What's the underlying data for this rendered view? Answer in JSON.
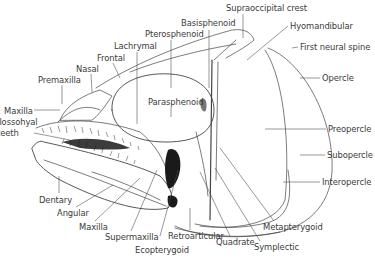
{
  "diagram": {
    "labels": [
      {
        "id": "supraoccipital-crest",
        "text": "Supraoccipital crest",
        "x": 226,
        "y": 3
      },
      {
        "id": "basisphenoid",
        "text": "Basisphenoid",
        "x": 181,
        "y": 18
      },
      {
        "id": "hyomandibular",
        "text": "Hyomandibular",
        "x": 290,
        "y": 21
      },
      {
        "id": "pterosphenoid",
        "text": "Pterosphenoid",
        "x": 145,
        "y": 29
      },
      {
        "id": "first-neural-spine",
        "text": "First neural spine",
        "x": 300,
        "y": 42
      },
      {
        "id": "lachrymal",
        "text": "Lachrymal",
        "x": 114,
        "y": 41
      },
      {
        "id": "frontal",
        "text": "Frontal",
        "x": 97,
        "y": 53
      },
      {
        "id": "nasal",
        "text": "Nasal",
        "x": 76,
        "y": 64
      },
      {
        "id": "premaxilla",
        "text": "Premaxilla",
        "x": 38,
        "y": 75
      },
      {
        "id": "opercle",
        "text": "Opercle",
        "x": 322,
        "y": 73
      },
      {
        "id": "parasphenoid",
        "text": "Parasphenoid",
        "x": 148,
        "y": 97
      },
      {
        "id": "maxilla-top",
        "text": "Maxilla",
        "x": 4,
        "y": 106
      },
      {
        "id": "glossohyal-teeth-1",
        "text": "Glossohyal",
        "x": 0,
        "y": 117
      },
      {
        "id": "glossohyal-teeth-2",
        "text": "teeth",
        "x": 0,
        "y": 128
      },
      {
        "id": "preopercle",
        "text": "Preopercle",
        "x": 328,
        "y": 124
      },
      {
        "id": "subopercle",
        "text": "Subopercle",
        "x": 327,
        "y": 150
      },
      {
        "id": "interopercle",
        "text": "Interopercle",
        "x": 322,
        "y": 177
      },
      {
        "id": "dentary",
        "text": "Dentary",
        "x": 39,
        "y": 195
      },
      {
        "id": "angular",
        "text": "Angular",
        "x": 57,
        "y": 208
      },
      {
        "id": "maxilla-bottom",
        "text": "Maxilla",
        "x": 79,
        "y": 222
      },
      {
        "id": "metapterygoid",
        "text": "Metapterygoid",
        "x": 263,
        "y": 222
      },
      {
        "id": "supermaxilla",
        "text": "Supermaxilla",
        "x": 105,
        "y": 232
      },
      {
        "id": "retroarticular",
        "text": "Retroarticular",
        "x": 168,
        "y": 231
      },
      {
        "id": "quadrate",
        "text": "Quadrate",
        "x": 216,
        "y": 237
      },
      {
        "id": "symplectic",
        "text": "Symplectic",
        "x": 254,
        "y": 242
      },
      {
        "id": "ecopterygoid",
        "text": "Ecopterygoid",
        "x": 135,
        "y": 245
      }
    ]
  }
}
